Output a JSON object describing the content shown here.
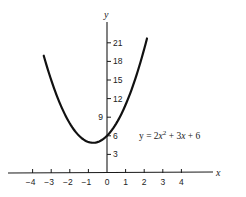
{
  "chart_data": {
    "type": "line",
    "title": "",
    "xlabel": "x",
    "ylabel": "y",
    "equation": "y = 2x^2 + 3x + 6",
    "annotation": {
      "prefix": "y = 2",
      "var1": "x",
      "exp": "2",
      "mid": " + 3",
      "var2": "x",
      "suffix": " + 6"
    },
    "x_ticks": [
      -4,
      -3,
      -2,
      -1,
      0,
      1,
      2,
      3,
      4
    ],
    "x_tick_labels": [
      "−4",
      "−3",
      "−2",
      "−1",
      "0",
      "1",
      "2",
      "3",
      "4"
    ],
    "y_ticks": [
      3,
      6,
      9,
      12,
      15,
      18,
      21
    ],
    "y_tick_labels": [
      "3",
      "6",
      "9",
      "12",
      "15",
      "18",
      "21"
    ],
    "xlim": [
      -5.2,
      6.8
    ],
    "ylim": [
      0,
      24
    ],
    "grid": false,
    "legend": "none",
    "series": [
      {
        "name": "y = 2x^2 + 3x + 6",
        "function": {
          "a": 2,
          "b": 3,
          "c": 6
        },
        "x_range": [
          -3.4,
          2.15
        ],
        "x": [
          -3.4,
          -3,
          -2.5,
          -2,
          -1.5,
          -1,
          -0.75,
          -0.5,
          0,
          0.5,
          1,
          1.5,
          2,
          2.15
        ],
        "values": [
          18.92,
          15,
          11,
          8,
          6,
          5,
          4.875,
          5,
          6,
          8,
          11,
          15,
          20,
          21.7
        ]
      }
    ],
    "vertex": {
      "x": -0.75,
      "y": 4.875
    },
    "y_intercept": 6
  }
}
